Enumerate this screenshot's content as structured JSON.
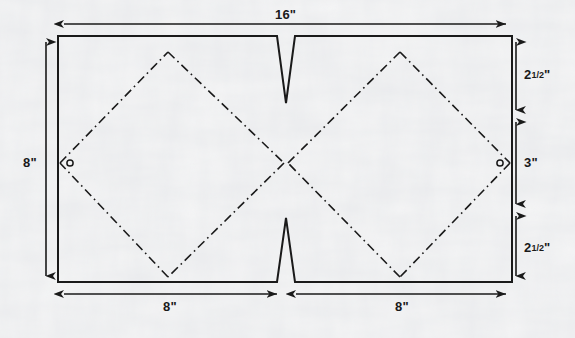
{
  "diagram": {
    "type": "technical-pattern-drawing",
    "units": "inches",
    "background_color": "#fbfbfa",
    "line_color": "#1a1a1a",
    "panel": {
      "outline_label": "cut-rectangle-outline",
      "width_in": 16,
      "height_in": 8
    },
    "dimensions": {
      "top": {
        "label": "16\"",
        "value": 16,
        "unit": "in",
        "name": "overall-width"
      },
      "left": {
        "label": "8\"",
        "value": 8,
        "unit": "in",
        "name": "overall-height"
      },
      "bottom_left": {
        "label": "8\"",
        "value": 8,
        "unit": "in",
        "name": "left-half-width"
      },
      "bottom_right": {
        "label": "8\"",
        "value": 8,
        "unit": "in",
        "name": "right-half-width"
      },
      "right_top": {
        "label_whole": "2",
        "label_fraction": "1/2",
        "label_unit": "\"",
        "value": 2.5,
        "unit": "in",
        "name": "right-top-segment"
      },
      "right_middle": {
        "label": "3\"",
        "value": 3,
        "unit": "in",
        "name": "right-middle-segment"
      },
      "right_bottom": {
        "label_whole": "2",
        "label_fraction": "1/2",
        "label_unit": "\"",
        "value": 2.5,
        "unit": "in",
        "name": "right-bottom-segment"
      }
    },
    "features": {
      "top_notch": {
        "name": "top-v-notch",
        "shape": "v-notch",
        "position": "top-center"
      },
      "bottom_notch": {
        "name": "bottom-v-notch",
        "shape": "v-notch",
        "position": "bottom-center"
      },
      "fold_lines": {
        "name": "diamond-fold-lines",
        "style": "dash-dot",
        "count": 2,
        "description": "two diamonds formed by dash-dot fold lines"
      },
      "hole_left": {
        "name": "left-hole-marker",
        "shape": "circle"
      },
      "hole_right": {
        "name": "right-hole-marker",
        "shape": "circle"
      }
    }
  }
}
